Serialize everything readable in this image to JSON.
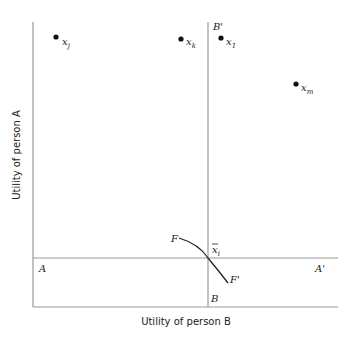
{
  "diagram": {
    "axes": {
      "x_label": "Utility of person B",
      "y_label": "Utility of person A"
    },
    "lines": {
      "vertical": {
        "top_label": "B'",
        "bottom_label": "B"
      },
      "horizontal": {
        "left_label": "A",
        "right_label": "A'"
      }
    },
    "curve": {
      "start_label": "F",
      "end_label": "F'"
    },
    "intersection": {
      "label": "x",
      "subscript": "i",
      "accent": "bar"
    },
    "points": [
      {
        "label": "x",
        "subscript": "j"
      },
      {
        "label": "x",
        "subscript": "k"
      },
      {
        "label": "x",
        "subscript": "1"
      },
      {
        "label": "x",
        "subscript": "m"
      }
    ]
  },
  "colors": {
    "line": "#9a9a9a",
    "text": "#222222",
    "point": "#111111",
    "curve": "#222222"
  }
}
